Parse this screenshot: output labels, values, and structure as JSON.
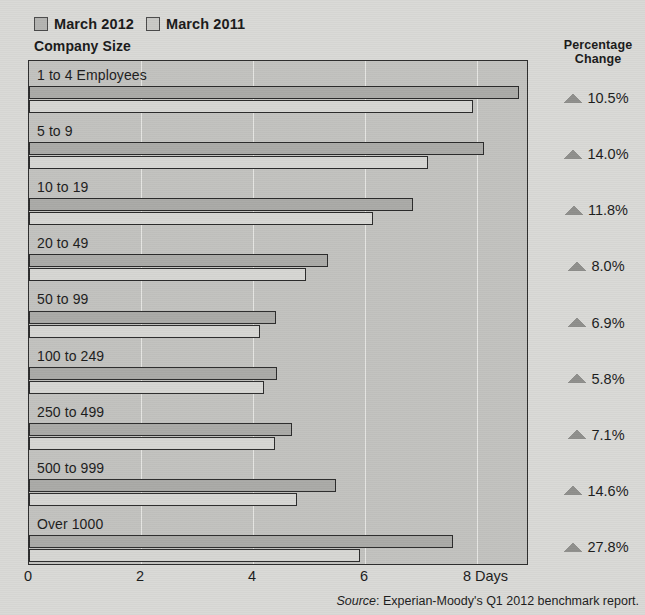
{
  "legend": {
    "entries": [
      {
        "label": "March 2012",
        "key": "2012"
      },
      {
        "label": "March 2011",
        "key": "2011"
      }
    ]
  },
  "axis_title": "Company Size",
  "percentage_header_line1": "Percentage",
  "percentage_header_line2": "Change",
  "source": {
    "prefix": "Source",
    "text": ": Experian-Moody's Q1 2012 benchmark report."
  },
  "colors": {
    "plot_background": "#c2c2bf",
    "page_background": "#d9d9d6",
    "bar_2012": "#aaaaa7",
    "bar_2011": "#d6d6d3",
    "border": "#2b2b2b",
    "gridline": "#e6e6e3",
    "triangle": "#8f8f8c"
  },
  "chart_data": {
    "type": "bar",
    "orientation": "horizontal",
    "title": "",
    "subtitle": "",
    "xlabel": "Days",
    "ylabel": "Company Size",
    "xlim": [
      0,
      8.93
    ],
    "xticks": [
      0,
      2,
      4,
      6,
      8
    ],
    "xtick_labels": [
      "0",
      "2",
      "4",
      "6",
      "8 Days"
    ],
    "grid": true,
    "grid_axis": "x",
    "legend_position": "top-left",
    "categories": [
      "1 to 4 Employees",
      "5 to 9",
      "10 to 19",
      "20 to 49",
      "50 to 99",
      "100 to 249",
      "250 to 499",
      "500 to 999",
      "Over 1000"
    ],
    "series": [
      {
        "name": "March 2012",
        "values": [
          8.76,
          8.12,
          6.86,
          5.34,
          4.41,
          4.43,
          4.7,
          5.48,
          7.57
        ]
      },
      {
        "name": "March 2011",
        "values": [
          7.93,
          7.12,
          6.14,
          4.94,
          4.13,
          4.19,
          4.39,
          4.78,
          5.92
        ]
      }
    ],
    "annotations": {
      "name": "Percentage Change",
      "marker": "up-triangle",
      "values": [
        "10.5%",
        "14.0%",
        "11.8%",
        "8.0%",
        "6.9%",
        "5.8%",
        "7.1%",
        "14.6%",
        "27.8%"
      ]
    }
  }
}
